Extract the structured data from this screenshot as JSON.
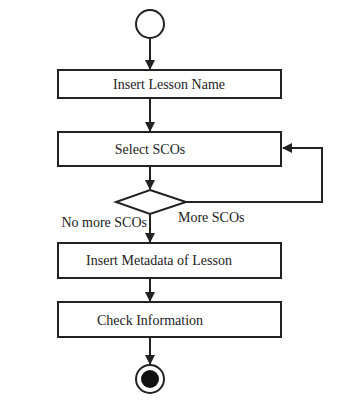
{
  "diagram": {
    "type": "activity-flowchart",
    "nodes": {
      "start": {
        "kind": "initial-node"
      },
      "insert_lesson_name": {
        "label": "Insert Lesson Name"
      },
      "select_scos": {
        "label": "Select SCOs"
      },
      "decision": {
        "kind": "decision"
      },
      "insert_metadata": {
        "label": "Insert Metadata of Lesson"
      },
      "check_information": {
        "label": "Check Information"
      },
      "end": {
        "kind": "final-node"
      }
    },
    "edges": {
      "no_more": {
        "label": "No more SCOs"
      },
      "more": {
        "label": "More SCOs"
      }
    },
    "colors": {
      "stroke": "#222222",
      "background": "#ffffff"
    }
  }
}
